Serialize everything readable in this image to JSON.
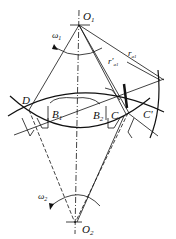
{
  "diagram": {
    "points": {
      "O1": {
        "label": "O",
        "sub": "1",
        "x": 79,
        "y": 25
      },
      "O2": {
        "label": "O",
        "sub": "2",
        "x": 75,
        "y": 223
      },
      "D": {
        "label": "D",
        "x": 29,
        "y": 110
      },
      "B1": {
        "label": "B",
        "sub": "1",
        "x": 52,
        "y": 112
      },
      "B2": {
        "label": "B",
        "sub": "2",
        "x": 97,
        "y": 114
      },
      "C": {
        "label": "C",
        "x": 116,
        "y": 113
      },
      "Cp": {
        "label": "C'",
        "x": 128,
        "y": 113
      }
    },
    "labels": {
      "omega1": "ω",
      "omega1_sub": "1",
      "omega2": "ω",
      "omega2_sub": "2",
      "ra1_prime": "r'",
      "ra1_prime_sub": "a1",
      "ra1": "r",
      "ra1_sub": "a1",
      "D": "D",
      "B1": "B",
      "B1_sub": "1",
      "B2": "B",
      "B2_sub": "2",
      "C": "C",
      "Cp": "C'",
      "O1": "O",
      "O1_sub": "1",
      "O2": "O",
      "O2_sub": "2"
    },
    "colors": {
      "line": "#111111",
      "background": "#ffffff"
    }
  }
}
